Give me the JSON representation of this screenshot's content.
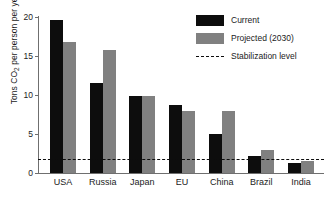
{
  "chart_data": {
    "type": "bar",
    "title": "",
    "xlabel": "",
    "ylabel": "Tons CO2 per person per year",
    "ylabel_prefix": "Tons CO",
    "ylabel_sub": "2",
    "ylabel_suffix": " per person per year",
    "categories": [
      "USA",
      "Russia",
      "Japan",
      "EU",
      "China",
      "Brazil",
      "India"
    ],
    "series": [
      {
        "name": "Current",
        "color": "#0d0d0d",
        "values": [
          19.6,
          11.6,
          9.9,
          8.7,
          5.0,
          2.2,
          1.3
        ]
      },
      {
        "name": "Projected (2030)",
        "color": "#808080",
        "values": [
          16.8,
          15.8,
          9.9,
          8.0,
          8.0,
          3.0,
          1.6
        ]
      }
    ],
    "reference_line": {
      "label": "Stabilization level",
      "value": 1.8,
      "color": "#0d0d0d",
      "style": "dashed"
    },
    "ylim": [
      0,
      20
    ],
    "yticks": [
      0,
      5,
      10,
      15,
      20
    ],
    "ytick_labels": [
      "0",
      "5",
      "10",
      "15",
      "20"
    ],
    "grid": false,
    "legend_position": "top-right"
  },
  "legend": {
    "items": [
      {
        "label": "Current",
        "type": "swatch",
        "color": "#0d0d0d"
      },
      {
        "label": "Projected (2030)",
        "type": "swatch",
        "color": "#808080"
      },
      {
        "label": "Stabilization level",
        "type": "dash",
        "color": "#0d0d0d"
      }
    ]
  }
}
